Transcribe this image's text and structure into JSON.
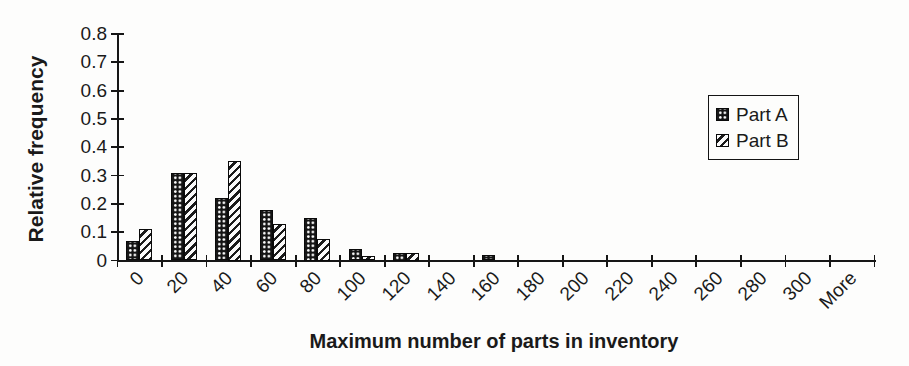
{
  "figure": {
    "background": "#fdfdfc",
    "ink": "#1a1a1a"
  },
  "chart_data": {
    "type": "bar",
    "title": "",
    "xlabel": "Maximum number of parts in inventory",
    "ylabel": "Relative frequency",
    "categories": [
      "0",
      "20",
      "40",
      "60",
      "80",
      "100",
      "120",
      "140",
      "160",
      "180",
      "200",
      "220",
      "240",
      "260",
      "280",
      "300",
      "More"
    ],
    "series": [
      {
        "name": "Part A",
        "pattern": "black-with-white-dot-grid",
        "values": [
          0.07,
          0.31,
          0.22,
          0.18,
          0.15,
          0.04,
          0.025,
          0,
          0.02,
          0,
          0,
          0,
          0,
          0,
          0,
          0,
          0
        ]
      },
      {
        "name": "Part B",
        "pattern": "white-with-diagonal-stripes",
        "values": [
          0.11,
          0.31,
          0.35,
          0.13,
          0.075,
          0.015,
          0.025,
          0,
          0,
          0,
          0,
          0,
          0,
          0,
          0,
          0,
          0
        ]
      }
    ],
    "ylim": [
      0,
      0.8
    ],
    "ytick_step": 0.1,
    "yticks": [
      "0",
      "0.1",
      "0.2",
      "0.3",
      "0.4",
      "0.5",
      "0.6",
      "0.7",
      "0.8"
    ],
    "grid": false,
    "legend_position": "right-inside",
    "bar_colors": {
      "ink": "#141414",
      "paper": "#fafafa"
    }
  }
}
